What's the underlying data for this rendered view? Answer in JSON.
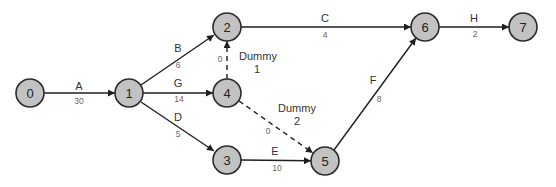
{
  "diagram": {
    "type": "activity-on-arrow network",
    "node_style": {
      "fill": "#c2c2c2",
      "stroke": "#2b2b2b",
      "radius": 14
    },
    "nodes": [
      {
        "id": "0",
        "label": "0",
        "x": 30,
        "y": 93
      },
      {
        "id": "1",
        "label": "1",
        "x": 129,
        "y": 93
      },
      {
        "id": "2",
        "label": "2",
        "x": 227,
        "y": 27
      },
      {
        "id": "3",
        "label": "3",
        "x": 227,
        "y": 160
      },
      {
        "id": "4",
        "label": "4",
        "x": 227,
        "y": 93
      },
      {
        "id": "5",
        "label": "5",
        "x": 325,
        "y": 161
      },
      {
        "id": "6",
        "label": "6",
        "x": 425,
        "y": 27
      },
      {
        "id": "7",
        "label": "7",
        "x": 523,
        "y": 27
      }
    ],
    "edges": [
      {
        "from": "0",
        "to": "1",
        "activity": "A",
        "duration": "30",
        "dashed": false
      },
      {
        "from": "1",
        "to": "2",
        "activity": "B",
        "duration": "6",
        "dashed": false
      },
      {
        "from": "1",
        "to": "4",
        "activity": "G",
        "duration": "14",
        "dashed": false
      },
      {
        "from": "1",
        "to": "3",
        "activity": "D",
        "duration": "5",
        "dashed": false
      },
      {
        "from": "2",
        "to": "6",
        "activity": "C",
        "duration": "4",
        "dashed": false
      },
      {
        "from": "4",
        "to": "2",
        "activity": "Dummy 1",
        "duration": "0",
        "dashed": true
      },
      {
        "from": "4",
        "to": "5",
        "activity": "Dummy 2",
        "duration": "0",
        "dashed": true
      },
      {
        "from": "3",
        "to": "5",
        "activity": "E",
        "duration": "10",
        "dashed": false
      },
      {
        "from": "5",
        "to": "6",
        "activity": "F",
        "duration": "8",
        "dashed": false
      },
      {
        "from": "6",
        "to": "7",
        "activity": "H",
        "duration": "2",
        "dashed": false
      }
    ],
    "labels": {
      "A": {
        "name": "A",
        "dur": "30"
      },
      "B": {
        "name": "B",
        "dur": "6"
      },
      "G": {
        "name": "G",
        "dur": "14"
      },
      "D": {
        "name": "D",
        "dur": "5"
      },
      "C": {
        "name": "C",
        "dur": "4"
      },
      "E": {
        "name": "E",
        "dur": "10"
      },
      "F": {
        "name": "F",
        "dur": "8"
      },
      "H": {
        "name": "H",
        "dur": "2"
      },
      "dummy1": {
        "line1": "Dummy",
        "line2": "1",
        "dur": "0"
      },
      "dummy2": {
        "line1": "Dummy",
        "line2": "2",
        "dur": "0"
      }
    }
  }
}
